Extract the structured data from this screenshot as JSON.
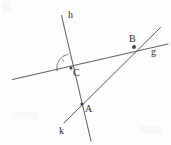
{
  "figure": {
    "background_color": "#fdfdfd",
    "stroke_color": "#4a4a4a",
    "label_color": "#2e2e2e",
    "width": 171,
    "height": 145
  },
  "labels": {
    "line_h": "h",
    "line_g": "g",
    "line_k": "k",
    "point_a": "A",
    "point_b": "B",
    "point_c": "C"
  },
  "geometry": {
    "lines": [
      {
        "name": "h",
        "label": "h",
        "x1": 61.5,
        "y1": 15.5,
        "x2": 91.0,
        "y2": 141.0,
        "label_x": 68,
        "label_y": 18
      },
      {
        "name": "g",
        "label": "g",
        "x1": 12.5,
        "y1": 79.5,
        "x2": 168.0,
        "y2": 44.0,
        "label_x": 151,
        "label_y": 55
      },
      {
        "name": "k",
        "label": "k",
        "x1": 64.0,
        "y1": 123.0,
        "x2": 160.5,
        "y2": 27.5,
        "label_x": 59,
        "label_y": 134
      }
    ],
    "points": [
      {
        "name": "C",
        "label": "C",
        "x": 71.0,
        "y": 68.0,
        "label_x": 73,
        "label_y": 76,
        "lines": [
          "g",
          "h"
        ]
      },
      {
        "name": "B",
        "label": "B",
        "x": 134.0,
        "y": 47.0,
        "label_x": 129,
        "label_y": 42,
        "lines": [
          "g",
          "k"
        ]
      },
      {
        "name": "A",
        "label": "A",
        "x": 82.0,
        "y": 104.0,
        "label_x": 85,
        "label_y": 112,
        "lines": [
          "h",
          "k"
        ]
      }
    ],
    "angle_marks": [
      {
        "name": "angle-at-C",
        "vertex_x": 71.0,
        "vertex_y": 68.0,
        "arc_path": "M 57.0 71.2 A 14.5 14.5 0 0 1 68.3 54.0",
        "tick_x1": 62.2,
        "tick_y1": 59.8,
        "tick_x2": 64.0,
        "tick_y2": 61.0
      }
    ]
  }
}
